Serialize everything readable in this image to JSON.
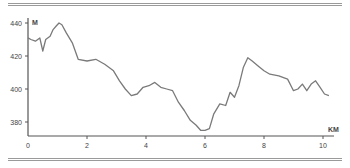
{
  "chart_data": {
    "type": "line",
    "title": "",
    "xlabel": "KM",
    "ylabel": "M",
    "xlim": [
      0,
      10.3
    ],
    "ylim": [
      373,
      442
    ],
    "x_ticks": [
      0,
      2,
      4,
      6,
      8,
      10
    ],
    "y_ticks": [
      380,
      400,
      420,
      440
    ],
    "grid": false,
    "legend": null,
    "colors": {
      "line": "#7a7a7a",
      "axis": "#555555",
      "rules": "#9a9a9a"
    },
    "series": [
      {
        "name": "elevation",
        "x": [
          0.0,
          0.1,
          0.25,
          0.4,
          0.45,
          0.5,
          0.6,
          0.75,
          0.85,
          0.95,
          1.05,
          1.15,
          1.3,
          1.5,
          1.7,
          2.0,
          2.3,
          2.6,
          2.9,
          3.1,
          3.3,
          3.5,
          3.7,
          3.9,
          4.1,
          4.3,
          4.5,
          4.7,
          4.9,
          5.1,
          5.3,
          5.5,
          5.7,
          5.85,
          6.0,
          6.15,
          6.3,
          6.5,
          6.7,
          6.85,
          7.0,
          7.15,
          7.3,
          7.45,
          7.6,
          7.8,
          8.0,
          8.2,
          8.5,
          8.8,
          9.0,
          9.15,
          9.3,
          9.45,
          9.6,
          9.75,
          9.9,
          10.05,
          10.2
        ],
        "y": [
          431,
          430,
          429,
          431,
          427,
          423,
          430,
          432,
          436,
          438,
          440,
          439,
          434,
          428,
          418,
          417,
          418,
          415,
          411,
          405,
          400,
          396,
          397,
          401,
          402,
          404,
          401,
          400,
          399,
          392,
          387,
          381,
          378,
          375,
          375,
          376,
          385,
          391,
          390,
          398,
          395,
          402,
          413,
          419,
          417,
          414,
          411,
          409,
          408,
          406,
          399,
          400,
          403,
          399,
          403,
          405,
          401,
          397,
          396
        ]
      }
    ]
  },
  "axis_labels": {
    "y_unit": "M",
    "x_unit": "KM",
    "y_ticks": [
      "440",
      "420",
      "400",
      "380"
    ],
    "x_ticks": [
      "0",
      "2",
      "4",
      "6",
      "8",
      "10"
    ]
  }
}
